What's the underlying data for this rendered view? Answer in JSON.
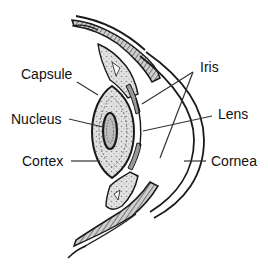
{
  "diagram": {
    "colors": {
      "ink": "#1a1a1a",
      "tissue_fill": "#d9d9d9",
      "lens_fill": "#e6e6e6",
      "background": "#ffffff"
    },
    "labels": {
      "capsule": "Capsule",
      "nucleus": "Nucleus",
      "cortex": "Cortex",
      "iris": "Iris",
      "lens": "Lens",
      "cornea": "Cornea"
    }
  }
}
